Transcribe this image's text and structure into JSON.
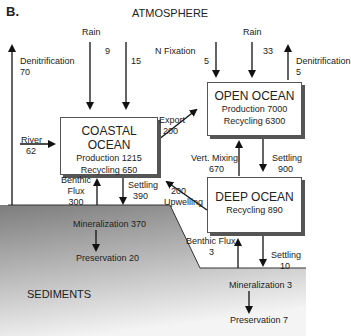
{
  "panel_label": "B.",
  "title": "ATMOSPHERE",
  "compartments": {
    "coastal": {
      "name": "COASTAL OCEAN",
      "line1": "Production 1215",
      "line2": "Recycling 650"
    },
    "open": {
      "name": "OPEN OCEAN",
      "line1": "Production 7000",
      "line2": "Recycling 6300"
    },
    "deep": {
      "name": "DEEP OCEAN",
      "line1": "Recycling 890"
    },
    "sediments": {
      "name": "SEDIMENTS"
    }
  },
  "flows": {
    "rain_coastal": {
      "label": "Rain",
      "v1": "9",
      "v2": "15"
    },
    "denit_left": {
      "label": "Denitrification",
      "value": "70"
    },
    "nfix": {
      "label": "N Fixation",
      "value": "5"
    },
    "rain_open": {
      "label": "Rain",
      "value": "33"
    },
    "denit_right": {
      "label": "Denitrification",
      "value": "5"
    },
    "export": {
      "label": "Export",
      "value": "200"
    },
    "river": {
      "label": "River",
      "value": "62"
    },
    "vert_mixing": {
      "label": "Vert. Mixing",
      "value": "670"
    },
    "settling_open": {
      "label": "Settling",
      "value": "900"
    },
    "upwelling": {
      "label": "Upwelling",
      "value": "200"
    },
    "benthic_coastal": {
      "l1": "Benthic",
      "l2": "Flux",
      "value": "300"
    },
    "settling_coastal": {
      "label": "Settling",
      "value": "390"
    },
    "benthic_deep": {
      "label": "Benthic Flux",
      "value": "3"
    },
    "settling_deep": {
      "label": "Settling",
      "value": "10"
    },
    "mineral_coastal": "Mineralization 370",
    "preserv_coastal": "Preservation 20",
    "mineral_deep": "Mineralization 3",
    "preserv_deep": "Preservation 7"
  }
}
